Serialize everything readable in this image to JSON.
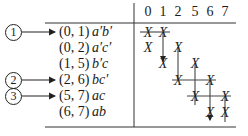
{
  "header": {
    "columns": [
      "0",
      "1",
      "2",
      "5",
      "6",
      "7"
    ]
  },
  "rows": [
    {
      "pair": "(0, 1)",
      "term": "a′b′",
      "callout": "1",
      "marks": [
        "0",
        "1"
      ]
    },
    {
      "pair": "(0, 2)",
      "term": "a′c′",
      "callout": "",
      "marks": [
        "0",
        "2"
      ]
    },
    {
      "pair": "(1, 5)",
      "term": "b′c",
      "callout": "",
      "marks": [
        "1",
        "5"
      ]
    },
    {
      "pair": "(2, 6)",
      "term": "bc′",
      "callout": "2",
      "marks": [
        "2",
        "6"
      ]
    },
    {
      "pair": "(5, 7)",
      "term": "ac",
      "callout": "3",
      "marks": [
        "5",
        "7"
      ]
    },
    {
      "pair": "(6, 7)",
      "term": "ab",
      "callout": "",
      "marks": [
        "6",
        "7"
      ]
    }
  ],
  "callouts": [
    {
      "label": "1",
      "row": 0
    },
    {
      "label": "2",
      "row": 3
    },
    {
      "label": "3",
      "row": 4
    }
  ],
  "mark_symbol": "X"
}
